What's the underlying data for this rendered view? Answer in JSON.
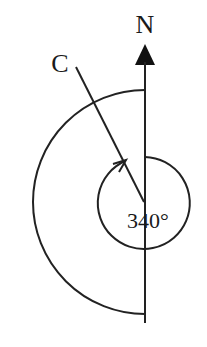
{
  "diagram": {
    "type": "bearing-diagram",
    "north_label": "N",
    "point_label": "C",
    "angle_label": "340°",
    "bearing_degrees": 340,
    "colors": {
      "stroke": "#222222",
      "background": "#ffffff"
    }
  }
}
